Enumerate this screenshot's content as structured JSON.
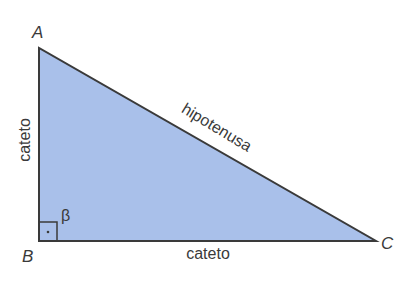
{
  "diagram": {
    "type": "right-triangle",
    "colors": {
      "fill": "#a9c0ea",
      "stroke": "#3a3a3a",
      "text": "#3a3a3a",
      "background": "#ffffff"
    },
    "vertices": [
      {
        "id": "A",
        "label": "A",
        "x": 39,
        "y": 48
      },
      {
        "id": "B",
        "label": "B",
        "x": 39,
        "y": 241
      },
      {
        "id": "C",
        "label": "C",
        "x": 376,
        "y": 241
      }
    ],
    "sides": {
      "vertical_leg": "cateto",
      "horizontal_leg": "cateto",
      "hypotenuse": "hipotenusa"
    },
    "angle": {
      "label": "β",
      "vertex": "B",
      "right_angle_marker": true
    }
  }
}
